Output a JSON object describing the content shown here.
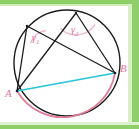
{
  "figure": {
    "canvas": {
      "width": 139,
      "height": 129,
      "background": "#ffffff"
    },
    "frame": {
      "name": "green-border-frame",
      "color": "#8fcf6a",
      "highlight_color": "#c9e8b0",
      "top_thickness": 4,
      "right_thickness": 7,
      "bottom_thickness": 4,
      "left_thickness": 0
    },
    "colors": {
      "stroke_black": "#1c1c1c",
      "chord_cyan": "#29c4d8",
      "arc_pink": "#e07a96",
      "label_pink": "#e8719a",
      "angle_arc_pink": "#f0b9c8"
    },
    "circle": {
      "name": "main-circle",
      "cx": 67,
      "cy": 63,
      "r": 53,
      "stroke": "#1c1c1c",
      "stroke_width": 1.4
    },
    "points": [
      {
        "id": "A",
        "label": "A",
        "x": 17,
        "y": 91,
        "label_x": 6,
        "label_y": 95,
        "color": "#e8719a"
      },
      {
        "id": "B",
        "label": "B",
        "x": 115,
        "y": 73,
        "label_x": 122,
        "label_y": 71,
        "color": "#e8719a"
      },
      {
        "id": "C1",
        "label": "",
        "x": 27,
        "y": 26,
        "label_x": 0,
        "label_y": 0,
        "color": "#1c1c1c"
      },
      {
        "id": "C2",
        "label": "",
        "x": 76,
        "y": 13,
        "label_x": 0,
        "label_y": 0,
        "color": "#1c1c1c"
      }
    ],
    "segments": [
      {
        "name": "segment-C1-A",
        "from": "C1",
        "to": "A",
        "color": "#1c1c1c",
        "width": 1.3
      },
      {
        "name": "segment-C1-B",
        "from": "C1",
        "to": "B",
        "color": "#1c1c1c",
        "width": 1.3
      },
      {
        "name": "segment-C2-A",
        "from": "C2",
        "to": "A",
        "color": "#1c1c1c",
        "width": 1.3
      },
      {
        "name": "segment-C2-B",
        "from": "C2",
        "to": "B",
        "color": "#1c1c1c",
        "width": 1.3
      }
    ],
    "chord": {
      "name": "chord-AB",
      "from": "A",
      "to": "B",
      "color": "#29c4d8",
      "width": 1.6
    },
    "arc": {
      "name": "minor-arc-AB",
      "from": "A",
      "to": "B",
      "color": "#e07a96",
      "width": 1.6,
      "sweep": "below"
    },
    "angles": [
      {
        "id": "gamma1",
        "name": "angle-gamma-1",
        "vertex": "C1",
        "label": "γ",
        "subscript": "1",
        "label_x": 33,
        "label_y": 39,
        "arc_radius": 19,
        "arc_color": "#f0b9c8",
        "label_color": "#e8719a"
      },
      {
        "id": "gamma2",
        "name": "angle-gamma-2",
        "vertex": "C2",
        "label": "γ",
        "subscript": "2",
        "label_x": 72,
        "label_y": 31,
        "arc_radius": 22,
        "arc_color": "#f0b9c8",
        "label_color": "#e8719a"
      }
    ]
  }
}
